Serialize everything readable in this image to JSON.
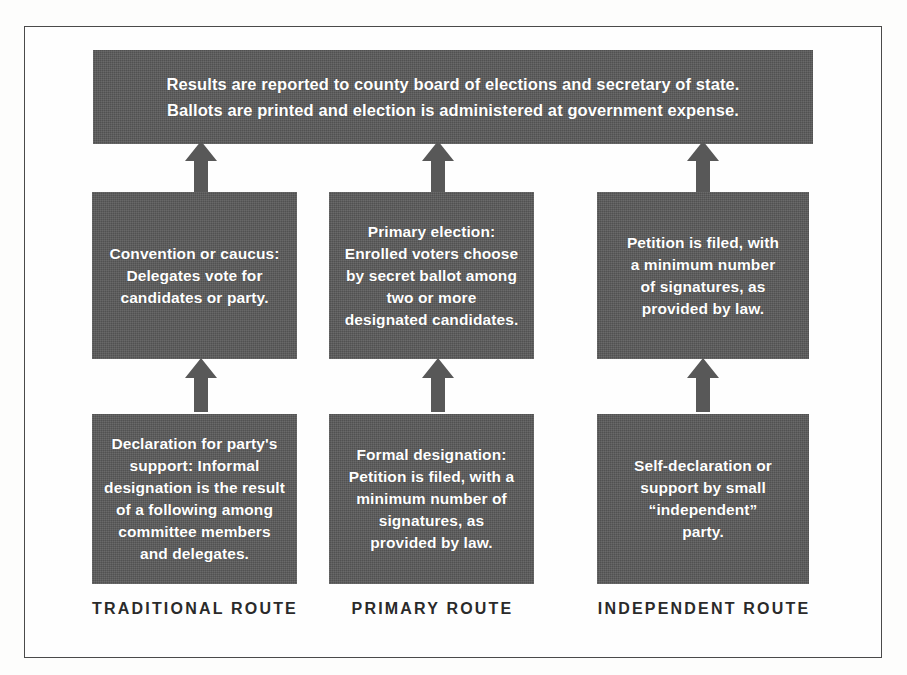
{
  "page": {
    "cut_off_header_text": "types of designating"
  },
  "figure": {
    "top_banner": {
      "text": "Results are reported to county board of elections and secretary of state.\nBallots are printed and election is administered at government expense."
    },
    "columns": [
      {
        "caption": "TRADITIONAL ROUTE",
        "middle_box": "Convention or caucus:\nDelegates vote for\ncandidates or party.",
        "bottom_box": "Declaration for party's\nsupport: Informal\ndesignation is the result\nof a following among\ncommittee members\nand delegates.",
        "arrow_top": "up-arrow-icon",
        "arrow_bottom": "up-arrow-icon"
      },
      {
        "caption": "PRIMARY ROUTE",
        "middle_box": "Primary election:\nEnrolled voters choose\nby secret ballot among\ntwo or more\ndesignated candidates.",
        "bottom_box": "Formal designation:\nPetition is filed, with a\nminimum number of\nsignatures, as\nprovided by law.",
        "arrow_top": "up-arrow-icon",
        "arrow_bottom": "up-arrow-icon"
      },
      {
        "caption": "INDEPENDENT ROUTE",
        "middle_box": "Petition is filed, with\na minimum number\nof signatures, as\nprovided by law.",
        "bottom_box": "Self-declaration or\nsupport by small\n“independent”\nparty.",
        "arrow_top": "up-arrow-icon",
        "arrow_bottom": "up-arrow-icon"
      }
    ]
  },
  "colors": {
    "box_fill": "#585858",
    "box_text": "#ffffff",
    "frame_border": "#4a4a4a",
    "caption_text": "#2a2a2a",
    "page_background": "#fdfdfc"
  }
}
